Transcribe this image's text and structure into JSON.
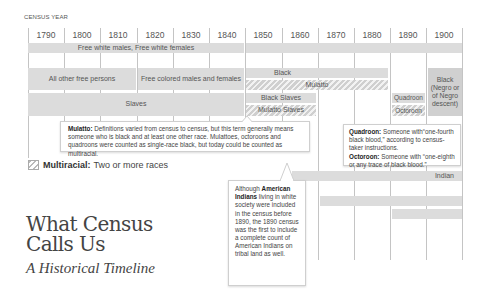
{
  "axis": {
    "label": "CENSUS YEAR",
    "years": [
      "1790",
      "1800",
      "1810",
      "1820",
      "1830",
      "1840",
      "1850",
      "1860",
      "1870",
      "1880",
      "1890",
      "1900"
    ]
  },
  "bars": {
    "free_white": "Free white males, Free white females",
    "all_other_free": "All other free persons",
    "free_colored": "Free colored males and females",
    "black": "Black",
    "black_1900": "Black (Negro or of Negro descent)",
    "mulatto": "Mulatto",
    "slaves": "Slaves",
    "black_slaves": "Black Slaves",
    "mulatto_slaves": "Mulatto  Slaves",
    "quadroon": "Quadroon",
    "octoroon": "Octoroon",
    "indian": "Indian"
  },
  "notes": {
    "mulatto": {
      "term": "Mulatto:",
      "text": "Definitions varied from census to census, but this term generally means someone who is black and at least one other race. Mulattoes, octoroons and quadroons were counted as single-race black, but today could be counted as multiracial."
    },
    "quadroon": {
      "term": "Quadroon:",
      "text": "Someone with“one-fourth black blood,” according to census-taker instructions."
    },
    "octoroon": {
      "term": "Octoroon:",
      "text": "Someone with “one-eighth or any trace of black blood.”"
    },
    "indian": {
      "pre": "Although",
      "term": "American Indians",
      "text": "living in white society were included in the census before 1890, the 1890 census was the first to include a complete count of American Indians on tribal land as well."
    }
  },
  "legend": {
    "term": "Multiracial:",
    "text": "Two or more races"
  },
  "title": {
    "main_line1": "What Census",
    "main_line2": "Calls Us",
    "subtitle": "A Historical Timeline"
  },
  "colors": {
    "bar_fill": "#dcdcdc",
    "grid": "#c4c4c4",
    "text": "#444444"
  }
}
